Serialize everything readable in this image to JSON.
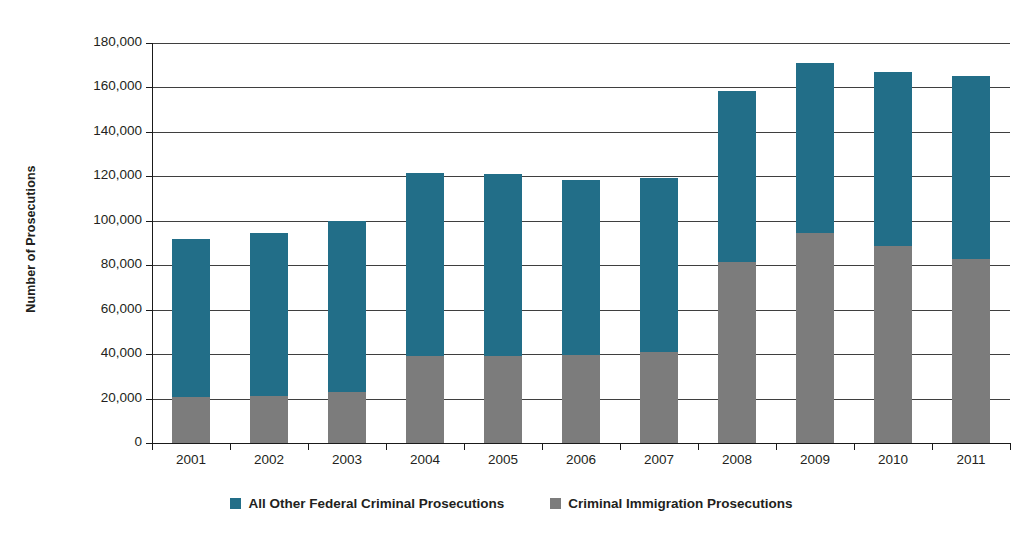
{
  "chart_data": {
    "type": "bar",
    "subtype": "stacked-column",
    "title": "",
    "xlabel": "",
    "ylabel": "Number of Prosecutions",
    "ylim": [
      0,
      180000
    ],
    "ytick_step": 20000,
    "ytick_labels": [
      "180,000",
      "160,000",
      "140,000",
      "120,000",
      "100,000",
      "80,000",
      "60,000",
      "40,000",
      "20,000",
      "0"
    ],
    "ytick_values": [
      180000,
      160000,
      140000,
      120000,
      100000,
      80000,
      60000,
      40000,
      20000,
      0
    ],
    "grid": true,
    "legend_position": "bottom",
    "categories": [
      "2001",
      "2002",
      "2003",
      "2004",
      "2005",
      "2006",
      "2007",
      "2008",
      "2009",
      "2010",
      "2011"
    ],
    "series": [
      {
        "name": "Criminal Immigration Prosecutions",
        "color": "#7c7c7c",
        "stack_order": 0,
        "values": [
          20700,
          21200,
          22900,
          39100,
          39300,
          39600,
          41000,
          81500,
          94500,
          88600,
          82800
        ]
      },
      {
        "name": "All Other Federal Criminal Prosecutions",
        "color": "#226e88",
        "stack_order": 1,
        "values": [
          70900,
          73100,
          77000,
          82400,
          81700,
          78800,
          78300,
          76900,
          76500,
          78400,
          82200
        ]
      }
    ],
    "totals": [
      91600,
      94300,
      99900,
      121500,
      121000,
      118400,
      119300,
      158400,
      171000,
      167000,
      165000
    ]
  },
  "legend": {
    "items": [
      {
        "label": "All Other Federal Criminal Prosecutions",
        "color": "#226e88"
      },
      {
        "label": "Criminal Immigration Prosecutions",
        "color": "#7c7c7c"
      }
    ]
  },
  "axis": {
    "y_title": "Number of Prosecutions"
  },
  "title_sliver": ""
}
